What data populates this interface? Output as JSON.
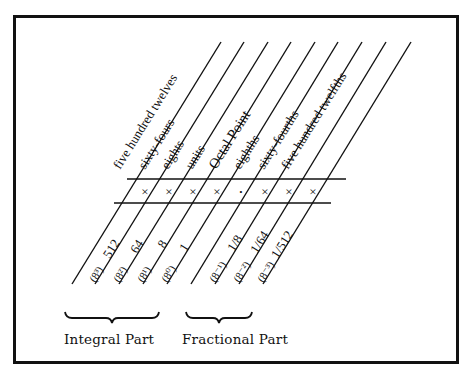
{
  "diagram": {
    "columns": [
      {
        "name": "five hundred twelves",
        "power": "8³",
        "value": "512",
        "cell": "×"
      },
      {
        "name": "sixty-fours",
        "power": "8²",
        "value": "64",
        "cell": "×"
      },
      {
        "name": "eights",
        "power": "8¹",
        "value": "8",
        "cell": "×"
      },
      {
        "name": "units",
        "power": "8⁰",
        "value": "1",
        "cell": "×"
      },
      {
        "name": "Octal Point",
        "power": "",
        "value": "",
        "cell": "·"
      },
      {
        "name": "eighths",
        "power": "8⁻¹",
        "value": "1/8",
        "cell": "×"
      },
      {
        "name": "sixty-fourths",
        "power": "8⁻²",
        "value": "1/64",
        "cell": "×"
      },
      {
        "name": "five hundred twelfths",
        "power": "8⁻³",
        "value": "1/512",
        "cell": "×"
      }
    ],
    "groups": {
      "integral": "Integral Part",
      "fractional": "Fractional Part"
    }
  }
}
